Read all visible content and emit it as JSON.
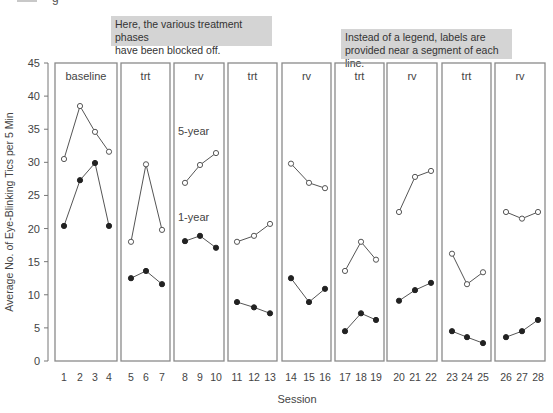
{
  "caption_fragment": {
    "glyph": "g"
  },
  "annotations": [
    {
      "text_line1": "Here, the various treatment phases",
      "text_line2": "have been blocked off."
    },
    {
      "text_line1": "Instead of a legend, labels are",
      "text_line2": "provided near a segment of each line."
    }
  ],
  "chart_data": {
    "type": "line",
    "title": "",
    "xlabel": "Session",
    "ylabel": "Average No. of Eye-Blinking Tics per 5 Min",
    "ylim": [
      0,
      45
    ],
    "yticks": [
      0,
      5,
      10,
      15,
      20,
      25,
      30,
      35,
      40,
      45
    ],
    "grid": false,
    "legend": "none (inline labels)",
    "inline_labels": [
      {
        "text": "5-year",
        "series": "5-year",
        "near_session": 8,
        "y_value": 34.8
      },
      {
        "text": "1-year",
        "series": "1-year",
        "near_session": 8,
        "y_value": 21.7
      }
    ],
    "phases": [
      {
        "label": "baseline",
        "sessions": [
          1,
          2,
          3,
          4
        ]
      },
      {
        "label": "trt",
        "sessions": [
          5,
          6,
          7
        ]
      },
      {
        "label": "rv",
        "sessions": [
          8,
          9,
          10
        ]
      },
      {
        "label": "trt",
        "sessions": [
          11,
          12,
          13
        ]
      },
      {
        "label": "rv",
        "sessions": [
          14,
          15,
          16
        ]
      },
      {
        "label": "trt",
        "sessions": [
          17,
          18,
          19
        ]
      },
      {
        "label": "rv",
        "sessions": [
          20,
          21,
          22
        ]
      },
      {
        "label": "trt",
        "sessions": [
          23,
          24,
          25
        ]
      },
      {
        "label": "rv",
        "sessions": [
          26,
          27,
          28
        ]
      }
    ],
    "x": [
      1,
      2,
      3,
      4,
      5,
      6,
      7,
      8,
      9,
      10,
      11,
      12,
      13,
      14,
      15,
      16,
      17,
      18,
      19,
      20,
      21,
      22,
      23,
      24,
      25,
      26,
      27,
      28
    ],
    "series": [
      {
        "name": "5-year",
        "marker": "open-circle",
        "values": [
          30.5,
          38.5,
          34.6,
          31.6,
          18.0,
          29.7,
          19.8,
          26.9,
          29.6,
          31.4,
          18.0,
          18.9,
          20.7,
          29.8,
          26.9,
          26.1,
          13.6,
          18.0,
          15.3,
          22.5,
          27.8,
          28.7,
          16.2,
          11.6,
          13.4,
          22.5,
          21.5,
          22.5
        ]
      },
      {
        "name": "1-year",
        "marker": "filled-circle",
        "values": [
          20.4,
          27.3,
          29.9,
          20.4,
          12.5,
          13.6,
          11.6,
          18.1,
          18.9,
          17.1,
          8.9,
          8.1,
          7.2,
          12.5,
          8.9,
          10.9,
          4.5,
          7.2,
          6.2,
          9.1,
          10.7,
          11.8,
          4.5,
          3.6,
          2.7,
          3.6,
          4.5,
          6.2
        ]
      }
    ]
  }
}
